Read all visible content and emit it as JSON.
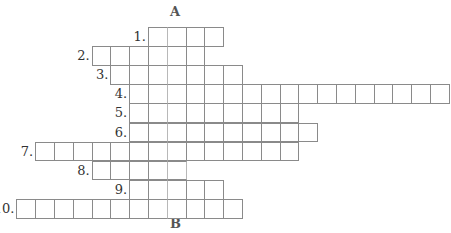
{
  "puzzle": {
    "label_top": "A",
    "label_bottom": "B",
    "key_column": 1,
    "origin_x": 148,
    "origin_y": 27,
    "cell_w": 18.8,
    "cell_h": 19.1,
    "rows": [
      {
        "number": "1.",
        "start": 0,
        "length": 4
      },
      {
        "number": "2.",
        "start": -3,
        "length": 6
      },
      {
        "number": "3.",
        "start": -2,
        "length": 7
      },
      {
        "number": "4.",
        "start": -1,
        "length": 17
      },
      {
        "number": "5.",
        "start": -1,
        "length": 9
      },
      {
        "number": "6.",
        "start": -1,
        "length": 10
      },
      {
        "number": "7.",
        "start": -6,
        "length": 14
      },
      {
        "number": "8.",
        "start": -3,
        "length": 5
      },
      {
        "number": "9.",
        "start": -1,
        "length": 5
      },
      {
        "number": "10.",
        "start": -7,
        "length": 12
      }
    ]
  }
}
